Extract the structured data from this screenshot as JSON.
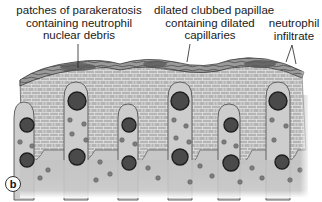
{
  "figure": {
    "panel_label": "b",
    "annotations": [
      {
        "id": "parakeratosis",
        "lines": [
          "patches of parakeratosis",
          "containing neutrophil",
          "nuclear debris"
        ],
        "pointer_to": "stratum corneum patch"
      },
      {
        "id": "papillae",
        "lines": [
          "dilated clubbed papillae",
          "containing dilated",
          "capillaries"
        ],
        "pointer_to": "dermal papilla"
      },
      {
        "id": "neutrophil",
        "lines": [
          "neutrophil",
          "infiltrate"
        ],
        "pointer_to": "stratum corneum patch"
      }
    ]
  },
  "colors": {
    "background": "#ffffff",
    "stratum_corneum": "#8a8a8a",
    "epidermis_fill": "#b9b9b9",
    "cell_outline": "#e8e8e8",
    "papilla_fill": "#cdcdcd",
    "dermis_fill": "#c4c4c4",
    "capillary_fill": "#4a4a4a",
    "capillary_outline": "#222222",
    "neutrophil_fill": "#7a7a7a",
    "text": "#1a1a1a"
  }
}
